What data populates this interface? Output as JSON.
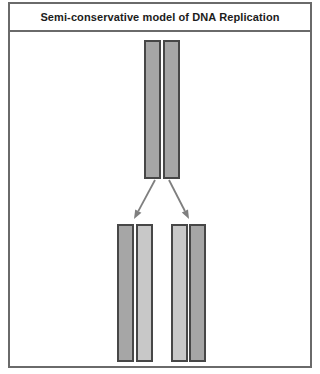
{
  "title": "Semi-conservative model of DNA Replication",
  "diagram": {
    "parent_molecule": {
      "strands": [
        "parental",
        "parental"
      ]
    },
    "daughter_molecules": [
      {
        "strands": [
          "parental",
          "new"
        ]
      },
      {
        "strands": [
          "new",
          "parental"
        ]
      }
    ]
  },
  "colors": {
    "parental_strand": "#a6a6a6",
    "new_strand": "#c8c8c8",
    "strand_border": "#474747",
    "arrow": "#7f7f7f",
    "frame_border": "#6a6a6a",
    "title_text": "#1c1c1c",
    "background": "#ffffff"
  }
}
